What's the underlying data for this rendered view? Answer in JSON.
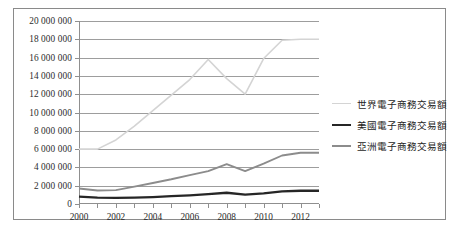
{
  "chart_data": {
    "type": "line",
    "title": "",
    "xlabel": "",
    "ylabel": "",
    "x": [
      2000,
      2001,
      2002,
      2003,
      2004,
      2005,
      2006,
      2007,
      2008,
      2009,
      2010,
      2011,
      2012,
      2013
    ],
    "xlim": [
      2000,
      2013
    ],
    "ylim": [
      0,
      20000000
    ],
    "xtick_labels": [
      "2000",
      "2002",
      "2004",
      "2006",
      "2008",
      "2010",
      "2012"
    ],
    "xtick_values": [
      2000,
      2002,
      2004,
      2006,
      2008,
      2010,
      2012
    ],
    "ytick_labels": [
      "20 000 000",
      "18 000 000",
      "16 000 000",
      "14 000 000",
      "12 000 000",
      "10 000 000",
      "8 000 000",
      "6 000 000",
      "4 000 000",
      "2 000 000",
      "0"
    ],
    "ytick_values": [
      20000000,
      18000000,
      16000000,
      14000000,
      12000000,
      10000000,
      8000000,
      6000000,
      4000000,
      2000000,
      0
    ],
    "grid": true,
    "legend_position": "right",
    "series": [
      {
        "name": "世界電子商務交易額",
        "color": "#d4d4d4",
        "width": 1.6,
        "values": [
          6000000,
          6000000,
          7000000,
          8500000,
          10200000,
          11900000,
          13600000,
          15800000,
          13700000,
          12000000,
          15900000,
          17900000,
          18000000,
          18000000
        ]
      },
      {
        "name": "美國電子商務交易額",
        "color": "#262626",
        "width": 2.3,
        "values": [
          800000,
          700000,
          680000,
          700000,
          760000,
          850000,
          950000,
          1080000,
          1230000,
          1030000,
          1160000,
          1380000,
          1450000,
          1450000
        ]
      },
      {
        "name": "亞洲電子商務交易額",
        "color": "#8c8c8c",
        "width": 1.9,
        "values": [
          1700000,
          1480000,
          1520000,
          1900000,
          2300000,
          2700000,
          3150000,
          3600000,
          4350000,
          3600000,
          4400000,
          5300000,
          5600000,
          5600000
        ]
      }
    ]
  },
  "legend": {
    "items": [
      {
        "label": "世界電子商務交易額",
        "color": "#d4d4d4",
        "width": "1.6px"
      },
      {
        "label": "美國電子商務交易額",
        "color": "#262626",
        "width": "2.6px"
      },
      {
        "label": "亞洲電子商務交易額",
        "color": "#8c8c8c",
        "width": "2px"
      }
    ]
  }
}
